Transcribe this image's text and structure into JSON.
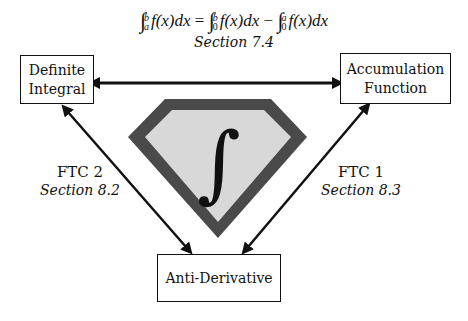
{
  "formula": {
    "lhs": {
      "lower": "a",
      "upper": "b",
      "integrand": "f(x)dx"
    },
    "equals": "=",
    "term1": {
      "lower": "0",
      "upper": "b",
      "integrand": "f(x)dx"
    },
    "minus": "−",
    "term2": {
      "lower": "0",
      "upper": "a",
      "integrand": "f(x)dx"
    },
    "integral_symbol": "∫",
    "section": "Section 7.4"
  },
  "nodes": {
    "definite_integral": {
      "line1": "Definite",
      "line2": "Integral"
    },
    "accumulation_function": {
      "line1": "Accumulation",
      "line2": "Function"
    },
    "anti_derivative": {
      "line1": "Anti-Derivative"
    }
  },
  "edges": {
    "left": {
      "title": "FTC 2",
      "section": "Section 8.2"
    },
    "right": {
      "title": "FTC 1",
      "section": "Section 8.3"
    }
  },
  "center_emblem": {
    "symbol": "∫",
    "outer_color": "#4a4a4a",
    "inner_color": "#d8d8d8"
  }
}
